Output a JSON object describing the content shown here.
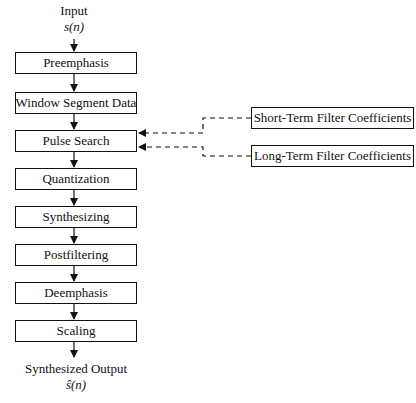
{
  "input": {
    "label": "Input",
    "signal": "s(n)"
  },
  "output": {
    "label": "Synthesized Output",
    "signal": "ŝ(n)"
  },
  "steps": [
    {
      "label": "Preemphasis"
    },
    {
      "label": "Window Segment Data"
    },
    {
      "label": "Pulse Search"
    },
    {
      "label": "Quantization"
    },
    {
      "label": "Synthesizing"
    },
    {
      "label": "Postfiltering"
    },
    {
      "label": "Deemphasis"
    },
    {
      "label": "Scaling"
    }
  ],
  "side_inputs": [
    {
      "label": "Short-Term Filter Coefficients",
      "target": "Pulse Search"
    },
    {
      "label": "Long-Term Filter Coefficients",
      "target": "Pulse Search"
    }
  ]
}
